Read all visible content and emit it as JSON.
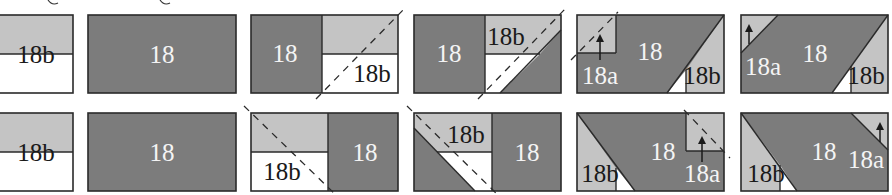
{
  "diagram": {
    "colors": {
      "dark_fabric": "#7c7c7c",
      "light_fabric": "#c4c4c4",
      "background_fabric": "#ffffff",
      "outline": "#2a2a2a"
    },
    "rows": [
      {
        "name": "row-top",
        "steps": [
          {
            "step": 1,
            "labels": [
              "18b"
            ]
          },
          {
            "step": 2,
            "labels": [
              "18"
            ]
          },
          {
            "step": 3,
            "labels": [
              "18",
              "18b"
            ]
          },
          {
            "step": 4,
            "labels": [
              "18",
              "18b"
            ]
          },
          {
            "step": 5,
            "labels": [
              "18a",
              "18",
              "18b"
            ]
          },
          {
            "step": 6,
            "labels": [
              "18a",
              "18",
              "18b"
            ]
          }
        ]
      },
      {
        "name": "row-bottom",
        "steps": [
          {
            "step": 1,
            "labels": [
              "18b"
            ]
          },
          {
            "step": 2,
            "labels": [
              "18"
            ]
          },
          {
            "step": 3,
            "labels": [
              "18b",
              "18"
            ]
          },
          {
            "step": 4,
            "labels": [
              "18b",
              "18"
            ]
          },
          {
            "step": 5,
            "labels": [
              "18b",
              "18",
              "18a"
            ]
          },
          {
            "step": 6,
            "labels": [
              "18b",
              "18",
              "18a"
            ]
          }
        ]
      }
    ],
    "text": {
      "t1": "18b",
      "t2": "18",
      "t3a": "18",
      "t3b": "18b",
      "t4a": "18",
      "t4b": "18b",
      "t5a": "18a",
      "t5b": "18",
      "t5c": "18b",
      "t6a": "18a",
      "t6b": "18",
      "t6c": "18b",
      "b1": "18b",
      "b2": "18",
      "b3a": "18b",
      "b3b": "18",
      "b4a": "18b",
      "b4b": "18",
      "b5a": "18b",
      "b5b": "18",
      "b5c": "18a",
      "b6a": "18b",
      "b6b": "18",
      "b6c": "18a"
    }
  }
}
